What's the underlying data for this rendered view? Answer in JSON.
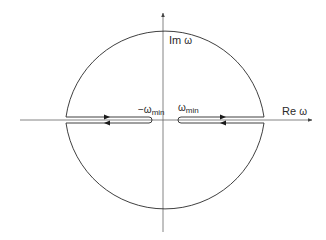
{
  "figure": {
    "type": "contour-diagram",
    "colors": {
      "background": "#ffffff",
      "stroke": "#2a2a2a",
      "axis": "#555555"
    }
  },
  "axes": {
    "imaginary": {
      "label": "Im ω",
      "label_main": "Im",
      "label_var": "ω"
    },
    "real": {
      "label": "Re ω",
      "label_main": "Re",
      "label_var": "ω"
    }
  },
  "labels": {
    "neg_omega_min": {
      "prefix": "−ω",
      "subscript": "min"
    },
    "pos_omega_min": {
      "prefix": "ω",
      "subscript": "min"
    }
  },
  "contour": {
    "circle_radius_px": 100,
    "arrows": [
      {
        "segment": "left-upper",
        "direction": "right"
      },
      {
        "segment": "left-lower",
        "direction": "left"
      },
      {
        "segment": "right-upper",
        "direction": "right"
      },
      {
        "segment": "right-lower",
        "direction": "left"
      }
    ]
  }
}
